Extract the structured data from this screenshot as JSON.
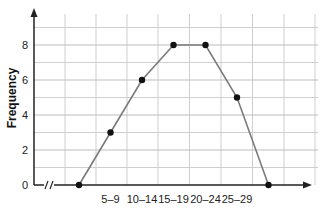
{
  "chart_data": {
    "type": "line",
    "title": "",
    "xlabel": "",
    "ylabel": "Frequency",
    "categories": [
      "",
      "5–9",
      "10–14",
      "15–19",
      "20–24",
      "25–29",
      ""
    ],
    "values": [
      0,
      3,
      6,
      8,
      8,
      5,
      0
    ],
    "x_tick_labels": [
      "5–9",
      "10–14",
      "15–19",
      "20–24",
      "25–29"
    ],
    "y_ticks": [
      0,
      2,
      4,
      6,
      8
    ],
    "ylim": [
      0,
      9.5
    ],
    "grid": true,
    "axis_break_on_x": true,
    "legend": null
  },
  "colors": {
    "line": "#7a7a7a",
    "marker": "#111111",
    "grid": "#cfcfcf",
    "axis": "#222222"
  }
}
